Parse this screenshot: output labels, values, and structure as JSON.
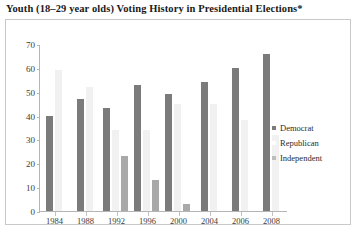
{
  "chart_data": {
    "type": "bar",
    "title": "Youth (18–29 year olds) Voting History in Presidential Elections*",
    "xlabel": "",
    "ylabel": "",
    "ylim": [
      0,
      70
    ],
    "yticks": [
      0,
      10,
      20,
      30,
      40,
      50,
      60,
      70
    ],
    "grid": false,
    "legend_position": "right",
    "categories": [
      "1984",
      "1988",
      "1992",
      "1996",
      "2000",
      "2004",
      "2006",
      "2008"
    ],
    "series": [
      {
        "name": "Democrat",
        "color": "#7b7b7b",
        "values": [
          40,
          47,
          43,
          53,
          49,
          54,
          60,
          66
        ]
      },
      {
        "name": "Republican",
        "color": "#f1f1f1",
        "values": [
          59,
          52,
          34,
          34,
          45,
          45,
          38,
          32
        ]
      },
      {
        "name": "Independent",
        "color": "#a9a9a9",
        "values": [
          0,
          0,
          23,
          13,
          3,
          0,
          0,
          0
        ]
      }
    ]
  }
}
